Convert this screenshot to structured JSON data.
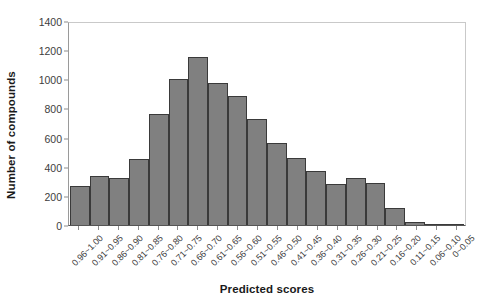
{
  "chart_data": {
    "type": "bar",
    "title": "",
    "xlabel": "Predicted scores",
    "ylabel": "Number of compounds",
    "ylim": [
      0,
      1400
    ],
    "yticks": [
      0,
      200,
      400,
      600,
      800,
      1000,
      1200,
      1400
    ],
    "grid": false,
    "legend": null,
    "bar_color": "#808080",
    "bar_edge_color": "#3a3a3a",
    "categories": [
      "0.96~1.00",
      "0.91~0.95",
      "0.86~0.90",
      "0.81~0.85",
      "0.76~0.80",
      "0.71~0.75",
      "0.66~0.70",
      "0.61~0.65",
      "0.56~0.60",
      "0.51~0.55",
      "0.46~0.50",
      "0.41~0.45",
      "0.36~0.40",
      "0.31~0.35",
      "0.26~0.30",
      "0.21~0.25",
      "0.16~0.20",
      "0.11~0.15",
      "0.06~0.10",
      "0~0.05"
    ],
    "values": [
      268,
      337,
      325,
      455,
      765,
      1005,
      1153,
      972,
      885,
      728,
      565,
      462,
      373,
      280,
      325,
      290,
      120,
      18,
      8,
      8
    ]
  }
}
